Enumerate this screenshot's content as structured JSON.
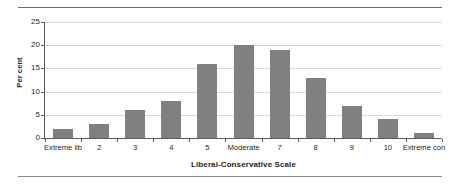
{
  "chart_data": {
    "type": "bar",
    "title": "",
    "xlabel": "Liberal-Conservative Scale",
    "ylabel": "Per cent",
    "categories": [
      "Extreme lib",
      "2",
      "3",
      "4",
      "5",
      "Moderate",
      "7",
      "8",
      "9",
      "10",
      "Extreme con"
    ],
    "values": [
      2,
      3,
      6,
      8,
      16,
      20,
      19,
      13,
      7,
      4,
      1
    ],
    "ylim": [
      0,
      25
    ],
    "yticks": [
      0,
      5,
      10,
      15,
      20,
      25
    ],
    "ytick_labels": [
      "0",
      "5",
      "10",
      "15",
      "20",
      "25"
    ],
    "grid": true,
    "legend": false,
    "bar_color": "#808080",
    "gridline_color": "#d9d9d9",
    "axis_color": "#58595b",
    "text_color": "#231f20"
  }
}
